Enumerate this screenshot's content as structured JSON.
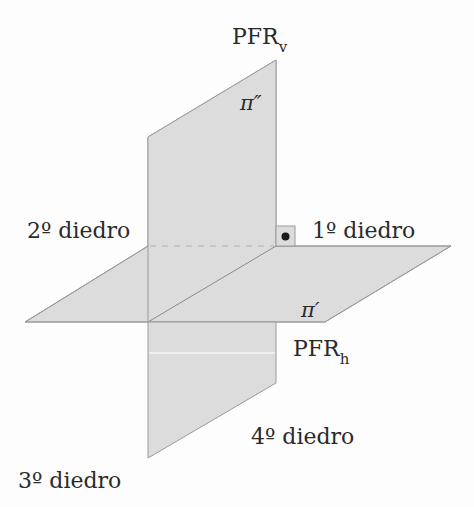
{
  "diagram": {
    "type": "descriptive-geometry-dihedral-planes",
    "colors": {
      "plane_fill": "#dcdcdc",
      "plane_edge": "#9a9a9a",
      "text": "#2a2a2a",
      "background": "#fdfdfd"
    },
    "labels": {
      "pfr_v_main": "PFR",
      "pfr_v_sub": "v",
      "pfr_h_main": "PFR",
      "pfr_h_sub": "h",
      "pi_vertical": "π″",
      "pi_horizontal": "π′",
      "dihedral_1": "1º diedro",
      "dihedral_2": "2º diedro",
      "dihedral_3": "3º diedro",
      "dihedral_4": "4º diedro"
    },
    "planes": [
      {
        "name": "vertical-plane",
        "symbol": "π″",
        "label": "PFRv"
      },
      {
        "name": "horizontal-plane",
        "symbol": "π′",
        "label": "PFRh"
      }
    ],
    "annotations": {
      "right_angle_marker": "•"
    }
  }
}
